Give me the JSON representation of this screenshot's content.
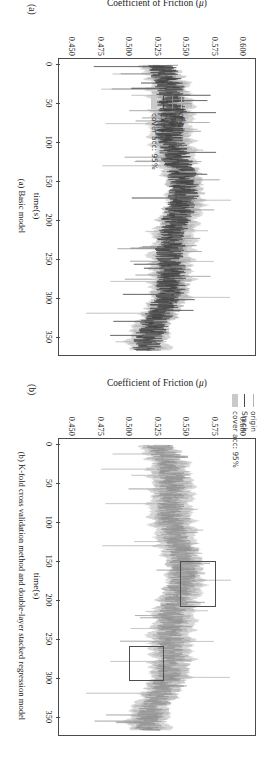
{
  "figure": {
    "orientation": "rotated-90",
    "panels": [
      {
        "letter": "(a)",
        "caption": "(a) Basic model",
        "legend": [
          {
            "label": "origin",
            "type": "line",
            "color": "#b4b4b4"
          },
          {
            "label": "BRR",
            "type": "line",
            "color": "#8a8a8a"
          },
          {
            "label": "Extra",
            "type": "line",
            "color": "#4a4a4a"
          },
          {
            "label": "cover acc: 95%",
            "type": "band",
            "color": "#c9c9c9"
          }
        ],
        "highlights": []
      },
      {
        "letter": "(b)",
        "caption": "(b) K-fold cross validation method and double-layer stacked regression model",
        "legend": [
          {
            "label": "origin",
            "type": "line",
            "color": "#b4b4b4"
          },
          {
            "label": "Stack",
            "type": "line",
            "color": "#4a4a4a"
          },
          {
            "label": "cover acc: 95%",
            "type": "band",
            "color": "#c9c9c9"
          }
        ],
        "highlights": [
          {
            "x0": 148,
            "x1": 205,
            "y0": 0.548,
            "y1": 0.578
          },
          {
            "x0": 258,
            "x1": 300,
            "y0": 0.503,
            "y1": 0.532
          }
        ]
      }
    ]
  },
  "chart_data": {
    "type": "line",
    "title": "",
    "xlabel": "time(s)",
    "ylabel": "Coefficient of Friction (μ)",
    "ylabel_text": "Coefficient of Friction",
    "ylabel_symbol": "μ",
    "xlim": [
      -8,
      372
    ],
    "ylim": [
      0.44,
      0.612
    ],
    "xticks": [
      0,
      50,
      100,
      150,
      200,
      250,
      300,
      350
    ],
    "xticklabels": [
      "0",
      "50",
      "100",
      "150",
      "200",
      "250",
      "300",
      "350"
    ],
    "yticks": [
      0.45,
      0.475,
      0.5,
      0.525,
      0.55,
      0.575,
      0.6
    ],
    "yticklabels": [
      "0.450",
      "0.475",
      "0.500",
      "0.525",
      "0.550",
      "0.575",
      "0.600"
    ],
    "grid": false,
    "legend_position": "inside",
    "series": [
      {
        "name": "origin",
        "color": "#b4b4b4",
        "panels": [
          "a",
          "b"
        ]
      },
      {
        "name": "BRR",
        "color": "#8a8a8a",
        "panels": [
          "a"
        ]
      },
      {
        "name": "Extra",
        "color": "#4a4a4a",
        "panels": [
          "a"
        ]
      },
      {
        "name": "Stack",
        "color": "#4a4a4a",
        "panels": [
          "b"
        ]
      },
      {
        "name": "cover acc: 95%",
        "color": "#c9c9c9",
        "panels": [
          "a",
          "b"
        ],
        "kind": "band"
      }
    ],
    "x": [
      0,
      2,
      4,
      6,
      8,
      10,
      12,
      14,
      16,
      18,
      20,
      22,
      24,
      26,
      28,
      30,
      32,
      34,
      36,
      38,
      40,
      42,
      44,
      46,
      48,
      50,
      52,
      54,
      56,
      58,
      60,
      62,
      64,
      66,
      68,
      70,
      72,
      74,
      76,
      78,
      80,
      82,
      84,
      86,
      88,
      90,
      92,
      94,
      96,
      98,
      100,
      102,
      104,
      106,
      108,
      110,
      112,
      114,
      116,
      118,
      120,
      122,
      124,
      126,
      128,
      130,
      132,
      134,
      136,
      138,
      140,
      142,
      144,
      146,
      148,
      150,
      152,
      154,
      156,
      158,
      160,
      162,
      164,
      166,
      168,
      170,
      172,
      174,
      176,
      178,
      180,
      182,
      184,
      186,
      188,
      190,
      192,
      194,
      196,
      198,
      200,
      202,
      204,
      206,
      208,
      210,
      212,
      214,
      216,
      218,
      220,
      222,
      224,
      226,
      228,
      230,
      232,
      234,
      236,
      238,
      240,
      242,
      244,
      246,
      248,
      250,
      252,
      254,
      256,
      258,
      260,
      262,
      264,
      266,
      268,
      270,
      272,
      274,
      276,
      278,
      280,
      282,
      284,
      286,
      288,
      290,
      292,
      294,
      296,
      298,
      300,
      302,
      304,
      306,
      308,
      310,
      312,
      314,
      316,
      318,
      320,
      322,
      324,
      326,
      328,
      330,
      332,
      334,
      336,
      338,
      340,
      342,
      344,
      346,
      348,
      350,
      352,
      354,
      356,
      358,
      360,
      362,
      364,
      366
    ],
    "values_origin": [
      0.528,
      0.531,
      0.542,
      0.519,
      0.537,
      0.548,
      0.522,
      0.515,
      0.534,
      0.549,
      0.527,
      0.512,
      0.54,
      0.553,
      0.526,
      0.509,
      0.531,
      0.545,
      0.521,
      0.496,
      0.543,
      0.556,
      0.524,
      0.505,
      0.535,
      0.551,
      0.519,
      0.5,
      0.461,
      0.538,
      0.557,
      0.529,
      0.512,
      0.541,
      0.554,
      0.526,
      0.507,
      0.533,
      0.549,
      0.523,
      0.504,
      0.537,
      0.552,
      0.527,
      0.51,
      0.539,
      0.556,
      0.53,
      0.513,
      0.542,
      0.558,
      0.533,
      0.515,
      0.544,
      0.56,
      0.535,
      0.517,
      0.546,
      0.561,
      0.536,
      0.518,
      0.547,
      0.563,
      0.538,
      0.519,
      0.548,
      0.564,
      0.54,
      0.521,
      0.55,
      0.566,
      0.541,
      0.523,
      0.551,
      0.567,
      0.543,
      0.524,
      0.553,
      0.568,
      0.544,
      0.526,
      0.555,
      0.57,
      0.546,
      0.527,
      0.556,
      0.572,
      0.547,
      0.529,
      0.558,
      0.573,
      0.549,
      0.53,
      0.559,
      0.575,
      0.55,
      0.532,
      0.561,
      0.576,
      0.552,
      0.533,
      0.562,
      0.578,
      0.553,
      0.535,
      0.564,
      0.579,
      0.555,
      0.536,
      0.565,
      0.581,
      0.556,
      0.538,
      0.567,
      0.582,
      0.558,
      0.539,
      0.568,
      0.584,
      0.559,
      0.541,
      0.57,
      0.585,
      0.561,
      0.542,
      0.571,
      0.587,
      0.562,
      0.544,
      0.573,
      0.588,
      0.564,
      0.545,
      0.574,
      0.59,
      0.565,
      0.547,
      0.576,
      0.591,
      0.567,
      0.548,
      0.577,
      0.593,
      0.568,
      0.55,
      0.579,
      0.594,
      0.57,
      0.551,
      0.58,
      0.596,
      0.571,
      0.553,
      0.582,
      0.597,
      0.573,
      0.554,
      0.583,
      0.599,
      0.574,
      0.556,
      0.585,
      0.6,
      0.576,
      0.557,
      0.586,
      0.602,
      0.577,
      0.559,
      0.588,
      0.603,
      0.579,
      0.56,
      0.589,
      0.605,
      0.58,
      0.562
    ]
  }
}
